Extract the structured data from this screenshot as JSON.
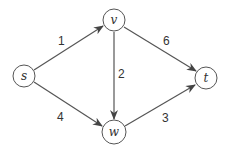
{
  "graph": {
    "nodes": [
      {
        "id": "s",
        "label": "s",
        "x": 24,
        "y": 76
      },
      {
        "id": "v",
        "label": "v",
        "x": 114,
        "y": 20
      },
      {
        "id": "w",
        "label": "w",
        "x": 114,
        "y": 132
      },
      {
        "id": "t",
        "label": "t",
        "x": 206,
        "y": 78
      }
    ],
    "edges": [
      {
        "from": "s",
        "to": "v",
        "weight": "1"
      },
      {
        "from": "s",
        "to": "w",
        "weight": "4"
      },
      {
        "from": "v",
        "to": "w",
        "weight": "2"
      },
      {
        "from": "v",
        "to": "t",
        "weight": "6"
      },
      {
        "from": "w",
        "to": "t",
        "weight": "3"
      }
    ]
  },
  "colors": {
    "stroke": "#444444",
    "text": "#333333",
    "background": "#ffffff"
  }
}
